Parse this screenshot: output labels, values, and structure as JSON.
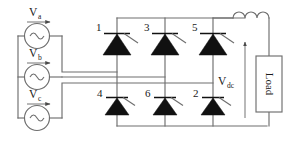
{
  "diagram": {
    "colors": {
      "wire": "#6e6e6e",
      "device_fill": "#111111",
      "text": "#1a1a1a",
      "background": "#ffffff"
    }
  },
  "sources": [
    {
      "id": "source-a",
      "label": "V",
      "subscript": "a",
      "symbol": "ac-source"
    },
    {
      "id": "source-b",
      "label": "V",
      "subscript": "b",
      "symbol": "ac-source"
    },
    {
      "id": "source-c",
      "label": "V",
      "subscript": "c",
      "symbol": "ac-source"
    }
  ],
  "thyristors": {
    "upper": [
      {
        "id": "thyristor-1",
        "label": "1"
      },
      {
        "id": "thyristor-3",
        "label": "3"
      },
      {
        "id": "thyristor-5",
        "label": "5"
      }
    ],
    "lower": [
      {
        "id": "thyristor-4",
        "label": "4"
      },
      {
        "id": "thyristor-6",
        "label": "6"
      },
      {
        "id": "thyristor-2",
        "label": "2"
      }
    ]
  },
  "output": {
    "inductor_label": "",
    "voltage_label": "V",
    "voltage_subscript": "dc",
    "load_label": "Load",
    "current_direction": "up"
  }
}
